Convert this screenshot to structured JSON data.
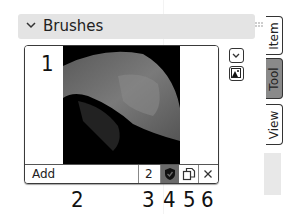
{
  "panel": {
    "title": "Brushes",
    "expanded": true
  },
  "brush_list": {
    "thumbnail_label": "1",
    "selected_brush": "brush thumbnail"
  },
  "toolbar": {
    "name_value": "Add",
    "users_count": "2",
    "fake_user_icon": "shield-icon",
    "duplicate_icon": "duplicate-icon",
    "unlink_icon": "close-icon"
  },
  "side_buttons": {
    "dropdown_icon": "chevron-down-icon",
    "image_icon": "image-icon"
  },
  "callout_labels": [
    "2",
    "3",
    "4",
    "5",
    "6"
  ],
  "tabs": [
    {
      "label": "Item",
      "active": false
    },
    {
      "label": "Tool",
      "active": true
    },
    {
      "label": "View",
      "active": false
    }
  ],
  "colors": {
    "header_bg": "#e4e4e4",
    "active_tab": "#8a8a8a",
    "fake_user_bg": "#6b6b6b"
  }
}
